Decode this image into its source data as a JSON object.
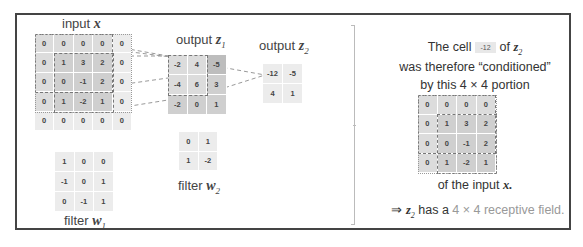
{
  "labels": {
    "input_x": "input ",
    "input_x_var": "x",
    "output_z1": "output ",
    "output_z1_var": "z",
    "output_z1_sub": "1",
    "output_z2": "output ",
    "output_z2_var": "z",
    "output_z2_sub": "2",
    "filter_w1": "filter ",
    "filter_w1_var": "w",
    "filter_w1_sub": "1",
    "filter_w2": "filter ",
    "filter_w2_var": "w",
    "filter_w2_sub": "2"
  },
  "input_x": [
    [
      "0",
      "0",
      "0",
      "0",
      "0"
    ],
    [
      "0",
      "1",
      "3",
      "2",
      "0"
    ],
    [
      "0",
      "0",
      "-1",
      "2",
      "0"
    ],
    [
      "0",
      "1",
      "-2",
      "1",
      "0"
    ],
    [
      "0",
      "0",
      "0",
      "0",
      "0"
    ]
  ],
  "output_z1": [
    [
      "-2",
      "4",
      "-5"
    ],
    [
      "-4",
      "6",
      "3"
    ],
    [
      "-2",
      "0",
      "1"
    ]
  ],
  "output_z2": [
    [
      "-12",
      "-5"
    ],
    [
      "4",
      "1"
    ]
  ],
  "filter_w1": [
    [
      "1",
      "0",
      "0"
    ],
    [
      "-1",
      "0",
      "1"
    ],
    [
      "0",
      "-1",
      "1"
    ]
  ],
  "filter_w2": [
    [
      "0",
      "1"
    ],
    [
      "1",
      "-2"
    ]
  ],
  "explanation": {
    "line1_a": "The cell",
    "line1_chip": "-12",
    "line1_b": "of ",
    "line1_var": "z",
    "line1_sub": "2",
    "line2": "was therefore “conditioned”",
    "line3": "by this 4 × 4 portion",
    "portion": [
      [
        "0",
        "0",
        "0",
        "0"
      ],
      [
        "0",
        "1",
        "3",
        "2"
      ],
      [
        "0",
        "0",
        "-1",
        "2"
      ],
      [
        "0",
        "1",
        "-2",
        "1"
      ]
    ],
    "line4_a": "of the input ",
    "line4_var": "x.",
    "line5_arrow": "⇒ ",
    "line5_var": "z",
    "line5_sub": "2",
    "line5_a": " has a ",
    "line5_b": "4 × 4 receptive field."
  },
  "colors": {
    "border": "#444444",
    "cell_light": "#ececec",
    "cell_mid": "#dcdcdc",
    "cell_dark": "#cfcfcf",
    "dashed": "#777777"
  }
}
